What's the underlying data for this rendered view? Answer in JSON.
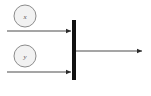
{
  "diagram": {
    "type": "petri-net-join",
    "background_color": "#ffffff",
    "nodes": [
      {
        "id": "place-x",
        "label": "x",
        "shape": "circle",
        "cx": 25,
        "cy": 16,
        "r": 11,
        "fill": "#f2f2f2",
        "stroke": "#8c8c8c",
        "stroke_width": 1
      },
      {
        "id": "place-y",
        "label": "y",
        "shape": "circle",
        "cx": 25,
        "cy": 56,
        "r": 11,
        "fill": "#f2f2f2",
        "stroke": "#8c8c8c",
        "stroke_width": 1
      }
    ],
    "bar": {
      "id": "transition-bar",
      "label": "",
      "x": 74,
      "y_top": 20,
      "y_bottom": 80,
      "thickness": 4,
      "color": "#111111"
    },
    "edges": [
      {
        "id": "edge-x-to-bar",
        "from": "place-x",
        "to": "transition-bar",
        "label": "",
        "x1": 7,
        "y1": 31,
        "x2": 72,
        "y2": 31,
        "color": "#4d4d4d",
        "stroke_width": 1,
        "arrowhead": true
      },
      {
        "id": "edge-y-to-bar",
        "from": "place-y",
        "to": "transition-bar",
        "label": "",
        "x1": 7,
        "y1": 72,
        "x2": 72,
        "y2": 72,
        "color": "#4d4d4d",
        "stroke_width": 1,
        "arrowhead": true
      },
      {
        "id": "edge-bar-output",
        "from": "transition-bar",
        "to": "output",
        "label": "",
        "x1": 76,
        "y1": 51,
        "x2": 143,
        "y2": 51,
        "color": "#4d4d4d",
        "stroke_width": 1,
        "arrowhead": true
      }
    ],
    "colors": {
      "node_fill": "#f2f2f2",
      "node_stroke": "#8c8c8c",
      "bar": "#111111",
      "edge": "#4d4d4d",
      "label_text": "#555555"
    }
  }
}
